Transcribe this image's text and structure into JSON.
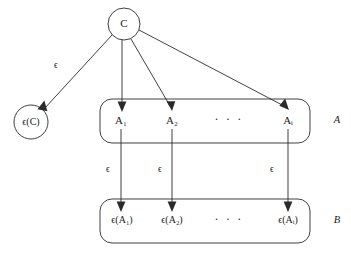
{
  "figure": {
    "kind": "commutative-diagram",
    "background_color": "#ffffff",
    "stroke_color": "#2b2b2b",
    "text_color": "#1a1a1a"
  },
  "nodes": {
    "source": {
      "id": "C",
      "label": "C",
      "shape": "circle",
      "cx": 124,
      "cy": 24,
      "r": 16
    },
    "source_image": {
      "id": "eps-C",
      "label": "ϵ(C)",
      "shape": "circle",
      "cx": 31,
      "cy": 122,
      "r": 17
    }
  },
  "groups": [
    {
      "id": "group-A",
      "label": "A",
      "label_x": 337,
      "label_y": 121,
      "box": {
        "x": 100,
        "y": 99,
        "w": 210,
        "h": 44,
        "rx": 12
      },
      "members": [
        {
          "id": "A1",
          "label": "A₁",
          "x": 121,
          "y": 121
        },
        {
          "id": "A2",
          "label": "A₂",
          "x": 172,
          "y": 121
        },
        {
          "id": "Ai",
          "label": "Aᵢ",
          "x": 288,
          "y": 121
        }
      ],
      "ellipsis": {
        "text": "· · ·",
        "x": 229,
        "y": 120
      }
    },
    {
      "id": "group-B",
      "label": "B",
      "label_x": 337,
      "label_y": 221,
      "box": {
        "x": 100,
        "y": 199,
        "w": 210,
        "h": 44,
        "rx": 12
      },
      "members": [
        {
          "id": "eps-A1",
          "label": "ϵ(A₁)",
          "x": 122,
          "y": 221
        },
        {
          "id": "eps-A2",
          "label": "ϵ(A₂)",
          "x": 172,
          "y": 221
        },
        {
          "id": "eps-Ai",
          "label": "ϵ(Aᵢ)",
          "x": 288,
          "y": 221
        }
      ],
      "ellipsis": {
        "text": "· · ·",
        "x": 229,
        "y": 220
      }
    }
  ],
  "edges": [
    {
      "id": "edge-C-to-epsC",
      "from": "C",
      "to": "eps-C",
      "label": "ϵ",
      "label_x": 56,
      "label_y": 66,
      "x1": 112,
      "y1": 35,
      "x2": 43,
      "y2": 110
    },
    {
      "id": "edge-C-to-A1",
      "from": "C",
      "to": "A1",
      "label": "",
      "x1": 122,
      "y1": 40,
      "x2": 121,
      "y2": 110
    },
    {
      "id": "edge-C-to-A2",
      "from": "C",
      "to": "A2",
      "label": "",
      "x1": 130,
      "y1": 39,
      "x2": 171,
      "y2": 110
    },
    {
      "id": "edge-C-to-Ai",
      "from": "C",
      "to": "Ai",
      "label": "",
      "x1": 138,
      "y1": 31,
      "x2": 288,
      "y2": 110
    },
    {
      "id": "edge-A1-to-epsA1",
      "from": "A1",
      "to": "eps-A1",
      "label": "ϵ",
      "label_x": 108,
      "label_y": 170,
      "x1": 121,
      "y1": 130,
      "x2": 121,
      "y2": 211
    },
    {
      "id": "edge-A2-to-epsA2",
      "from": "A2",
      "to": "eps-A2",
      "label": "ϵ",
      "label_x": 160,
      "label_y": 170,
      "x1": 172,
      "y1": 130,
      "x2": 172,
      "y2": 211
    },
    {
      "id": "edge-Ai-to-epsAi",
      "from": "Ai",
      "to": "eps-Ai",
      "label": "ϵ",
      "label_x": 272,
      "label_y": 170,
      "x1": 288,
      "y1": 130,
      "x2": 288,
      "y2": 211
    }
  ]
}
